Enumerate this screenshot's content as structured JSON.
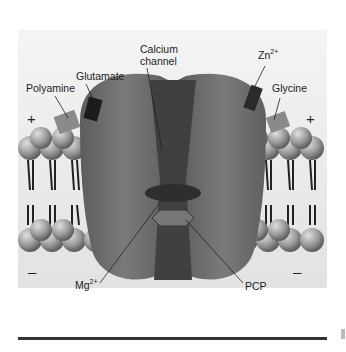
{
  "figure": {
    "labels": {
      "polyamine": "Polyamine",
      "glutamate": "Glutamate",
      "calcium_channel_line1": "Calcium",
      "calcium_channel_line2": "channel",
      "zinc": "Zn",
      "zinc_charge": "2+",
      "glycine": "Glycine",
      "magnesium": "Mg",
      "magnesium_charge": "2+",
      "pcp": "PCP"
    },
    "signs": {
      "top_left": "+",
      "top_right": "+",
      "bottom_left": "–",
      "bottom_right": "–"
    },
    "colors": {
      "protein": "#6e6e6e",
      "protein_dark": "#4a4a4a",
      "pore": "#3c3c3c",
      "membrane_head": "#9a9a9a",
      "background": "#ececec"
    }
  }
}
